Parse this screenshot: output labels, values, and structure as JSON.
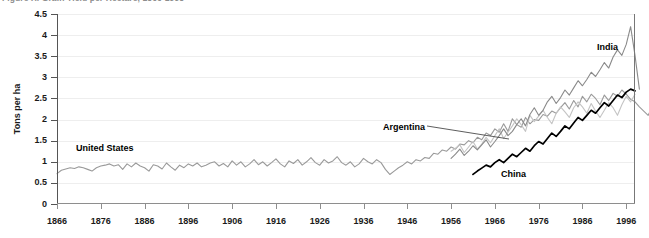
{
  "title_strip": {
    "text": "Figure X. Grain Yield per Hectare, 1866-1998"
  },
  "axes": {
    "ylabel": "Tons per ha",
    "yticks": [
      "0",
      "0.5",
      "1",
      "1.5",
      "2",
      "2.5",
      "3",
      "3.5",
      "4",
      "4.5"
    ],
    "xticks": [
      "1866",
      "1876",
      "1886",
      "1896",
      "1906",
      "1916",
      "1926",
      "1936",
      "1946",
      "1956",
      "1966",
      "1976",
      "1986",
      "1996"
    ]
  },
  "annotations": [
    {
      "name": "annotation-united-states",
      "label": "United States",
      "x": 76,
      "y": 143
    },
    {
      "name": "annotation-argentina",
      "label": "Argentina",
      "x": 383,
      "y": 122
    },
    {
      "name": "annotation-china",
      "label": "China",
      "x": 501,
      "y": 169
    },
    {
      "name": "annotation-india",
      "label": "India",
      "x": 597,
      "y": 42
    }
  ],
  "colors": {
    "united_states": "#9a9a9a",
    "argentina": "#c4c4c4",
    "india": "#8a8a8a",
    "china": "#000000",
    "grid": "#eeeeee",
    "axis": "#555555",
    "text": "#1a1a1a"
  },
  "chart_data": {
    "type": "line",
    "title": "Figure X. Grain Yield per Hectare, 1866-1998",
    "xlabel": "",
    "ylabel": "Tons per ha",
    "xlim": [
      1866,
      1998
    ],
    "ylim": [
      0,
      4.5
    ],
    "grid": true,
    "legend": "inline-annotations",
    "x_tick_interval": 10,
    "y_tick_interval": 0.5,
    "series": [
      {
        "name": "United States",
        "color": "#9a9a9a",
        "x_start": 1866,
        "values": [
          0.72,
          0.8,
          0.83,
          0.86,
          0.84,
          0.88,
          0.86,
          0.82,
          0.78,
          0.86,
          0.9,
          0.92,
          0.95,
          0.9,
          0.93,
          0.82,
          0.95,
          0.88,
          0.97,
          0.9,
          0.86,
          0.78,
          0.93,
          0.9,
          0.83,
          0.97,
          0.88,
          0.8,
          0.92,
          0.86,
          0.95,
          0.9,
          0.97,
          0.88,
          0.92,
          0.97,
          1.0,
          0.9,
          0.96,
          0.88,
          1.02,
          0.92,
          1.0,
          0.88,
          0.95,
          1.05,
          0.93,
          1.0,
          0.9,
          0.98,
          1.07,
          0.95,
          0.88,
          1.02,
          0.96,
          1.05,
          0.92,
          1.0,
          1.1,
          0.98,
          0.92,
          1.05,
          0.97,
          1.02,
          1.12,
          0.98,
          0.92,
          1.0,
          0.88,
          0.95,
          1.08,
          1.0,
          0.95,
          1.05,
          0.98,
          0.82,
          0.7,
          0.78,
          0.86,
          0.92,
          1.0,
          0.95,
          1.05,
          1.02,
          1.1,
          1.08,
          1.2,
          1.18,
          1.28,
          1.25,
          1.35,
          1.3,
          1.42,
          1.4,
          1.5,
          1.45,
          1.58,
          1.52,
          1.68,
          1.62,
          1.78,
          1.7,
          1.9,
          1.72,
          2.02,
          1.88,
          1.82,
          2.05,
          1.9,
          2.0,
          1.98,
          2.12,
          2.08,
          2.2,
          2.15,
          2.28,
          2.4,
          2.25,
          2.45,
          2.3,
          2.55,
          2.42,
          2.6,
          2.5,
          2.35,
          2.58,
          2.45,
          2.62,
          2.55,
          2.7,
          2.6,
          2.48,
          2.42,
          2.3,
          2.2,
          2.1,
          2.32,
          2.5,
          2.65,
          2.58
        ]
      },
      {
        "name": "Argentina",
        "color": "#c4c4c4",
        "x_start": 1956,
        "values": [
          1.25,
          1.32,
          1.4,
          1.22,
          1.35,
          1.48,
          1.3,
          1.42,
          1.58,
          1.45,
          1.62,
          1.78,
          1.55,
          1.7,
          1.85,
          2.02,
          1.88,
          1.72,
          2.1,
          1.95,
          2.08,
          2.22,
          2.05,
          1.9,
          2.15,
          2.3,
          2.18,
          2.05,
          2.28,
          2.42,
          2.3,
          2.15,
          2.38,
          2.2,
          2.05,
          2.22,
          2.4,
          2.28,
          2.1,
          2.35,
          2.55,
          2.42,
          2.6
        ]
      },
      {
        "name": "India",
        "color": "#8a8a8a",
        "x_start": 1956,
        "values": [
          1.08,
          1.18,
          1.3,
          1.15,
          1.25,
          1.38,
          1.28,
          1.4,
          1.52,
          1.35,
          1.48,
          1.62,
          1.78,
          1.62,
          1.72,
          1.88,
          2.02,
          1.85,
          2.12,
          2.28,
          2.1,
          2.22,
          2.42,
          2.55,
          2.38,
          2.52,
          2.7,
          2.58,
          2.75,
          2.92,
          2.8,
          2.95,
          3.12,
          3.02,
          3.18,
          3.35,
          3.22,
          3.48,
          3.65,
          3.52,
          3.78,
          4.2,
          3.52,
          2.72
        ]
      },
      {
        "name": "China",
        "color": "#000000",
        "x_start": 1961,
        "values": [
          0.7,
          0.78,
          0.85,
          0.92,
          0.88,
          0.98,
          1.05,
          0.98,
          1.08,
          1.18,
          1.12,
          1.22,
          1.32,
          1.25,
          1.38,
          1.48,
          1.42,
          1.55,
          1.68,
          1.6,
          1.72,
          1.85,
          1.78,
          1.92,
          2.05,
          1.98,
          2.1,
          2.22,
          2.15,
          2.28,
          2.4,
          2.32,
          2.45,
          2.58,
          2.52,
          2.65,
          2.72,
          2.68
        ]
      }
    ]
  }
}
